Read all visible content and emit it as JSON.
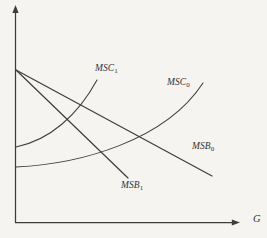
{
  "colors": {
    "background": "#f5f4f0",
    "line": "#3d3d3d",
    "text": "#333333"
  },
  "axes": {
    "x_label": "G",
    "y_label": ""
  },
  "curves": {
    "msc1": {
      "label": "MSC",
      "sub": "1",
      "d": "M 16 147 C 50 140 78 115 97 80"
    },
    "msc0": {
      "label": "MSC",
      "sub": "0",
      "d": "M 16 167 C 80 164 165 141 203 83"
    },
    "msb0": {
      "label": "MSB",
      "sub": "0",
      "d": "M 16 70 L 212 176"
    },
    "msb1": {
      "label": "MSB",
      "sub": "1",
      "d": "M 16 70 L 128 178"
    }
  }
}
